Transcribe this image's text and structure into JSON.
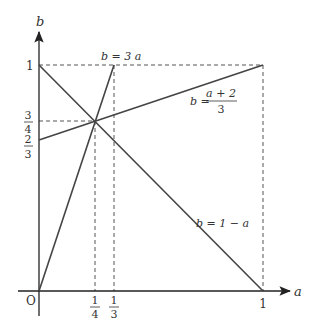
{
  "diagram": {
    "axes": {
      "x_label": "a",
      "y_label": "b",
      "origin_label": "O"
    },
    "ticks": {
      "x": [
        {
          "value": 0.25,
          "num": "1",
          "den": "4"
        },
        {
          "value": 0.3333,
          "num": "1",
          "den": "3"
        },
        {
          "value": 1,
          "label": "1"
        }
      ],
      "y": [
        {
          "value": 1,
          "label": "1"
        },
        {
          "value": 0.75,
          "num": "3",
          "den": "4"
        },
        {
          "value": 0.6667,
          "num": "2",
          "den": "3"
        }
      ]
    },
    "lines": [
      {
        "name": "b=3a",
        "label": "b = 3 a",
        "from": [
          0,
          0
        ],
        "to": [
          0.3333,
          1
        ]
      },
      {
        "name": "b=(a+2)/3",
        "label_lhs": "b =",
        "label_num": "a + 2",
        "label_den": "3",
        "from": [
          0,
          0.6667
        ],
        "to": [
          1,
          1
        ]
      },
      {
        "name": "b=1-a",
        "label": "b = 1 − a",
        "from": [
          0,
          1
        ],
        "to": [
          1,
          0
        ]
      }
    ],
    "intersection": {
      "a": 0.25,
      "b": 0.75
    },
    "colors": {
      "line": "#444444",
      "axis": "#222222",
      "dashed": "#555555"
    }
  }
}
